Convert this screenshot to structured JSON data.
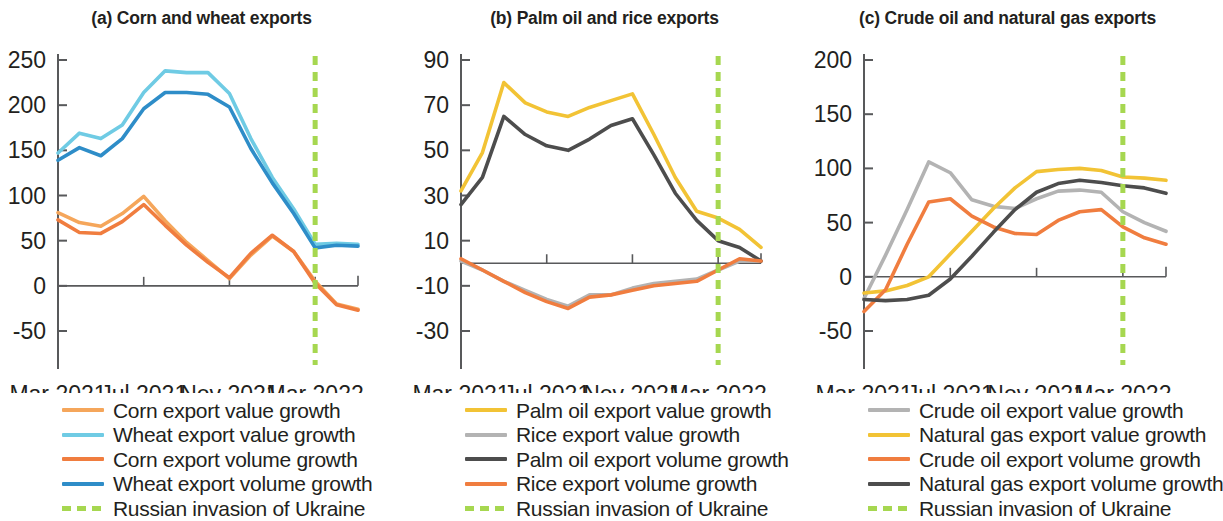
{
  "figure": {
    "panels": [
      {
        "id": "panel-a",
        "title": "(a) Corn and wheat exports",
        "legend": [
          {
            "label": "Corn export value growth",
            "color": "#f5a65b",
            "style": "solid"
          },
          {
            "label": "Wheat export value growth",
            "color": "#6fcbe4",
            "style": "solid"
          },
          {
            "label": "Corn export volume growth",
            "color": "#f07d3f",
            "style": "solid"
          },
          {
            "label": "Wheat export volume growth",
            "color": "#2e8dc8",
            "style": "solid"
          },
          {
            "label": "Russian invasion of Ukraine",
            "color": "#a6d750",
            "style": "dashed"
          }
        ]
      },
      {
        "id": "panel-b",
        "title": "(b) Palm oil and rice exports",
        "legend": [
          {
            "label": "Palm oil export value growth",
            "color": "#f2c335",
            "style": "solid"
          },
          {
            "label": "Rice export value growth",
            "color": "#b3b3b3",
            "style": "solid"
          },
          {
            "label": "Palm oil export volume growth",
            "color": "#4d4d4d",
            "style": "solid"
          },
          {
            "label": "Rice export volume growth",
            "color": "#f07d3f",
            "style": "solid"
          },
          {
            "label": "Russian invasion of Ukraine",
            "color": "#a6d750",
            "style": "dashed"
          }
        ]
      },
      {
        "id": "panel-c",
        "title": "(c) Crude oil and natural gas exports",
        "legend": [
          {
            "label": "Crude oil export value growth",
            "color": "#b3b3b3",
            "style": "solid"
          },
          {
            "label": "Natural gas export value growth",
            "color": "#f2c335",
            "style": "solid"
          },
          {
            "label": "Crude oil export volume growth",
            "color": "#f07d3f",
            "style": "solid"
          },
          {
            "label": "Natural gas export volume growth",
            "color": "#4d4d4d",
            "style": "solid"
          },
          {
            "label": "Russian invasion of Ukraine",
            "color": "#a6d750",
            "style": "dashed"
          }
        ]
      }
    ]
  },
  "chart_data": [
    {
      "type": "line",
      "title": "(a) Corn and wheat exports",
      "xlabel": "",
      "ylabel": "",
      "x": [
        "Mar 2021",
        "Apr 2021",
        "May 2021",
        "Jun 2021",
        "Jul 2021",
        "Aug 2021",
        "Sep 2021",
        "Oct 2021",
        "Nov 2021",
        "Dec 2021",
        "Jan 2022",
        "Feb 2022",
        "Mar 2022",
        "Apr 2022",
        "May 2022"
      ],
      "xticklabels": [
        "Mar 2021",
        "Jul 2021",
        "Nov 2021",
        "Mar 2022"
      ],
      "xtickindex": [
        0,
        4,
        8,
        12
      ],
      "ylim": [
        -50,
        250
      ],
      "yticks": [
        -50,
        0,
        50,
        100,
        150,
        200,
        250
      ],
      "grid": false,
      "legend_position": "below",
      "annotations": [
        {
          "type": "vline",
          "label": "Russian invasion of Ukraine",
          "x": "Mar 2022",
          "color": "#a6d750",
          "style": "dashed"
        }
      ],
      "series": [
        {
          "name": "Corn export value growth",
          "color": "#f5a65b",
          "values": [
            81,
            70,
            66,
            80,
            99,
            72,
            48,
            28,
            8,
            34,
            55,
            38,
            5,
            -20,
            -26
          ]
        },
        {
          "name": "Wheat export value growth",
          "color": "#6fcbe4",
          "values": [
            147,
            169,
            163,
            178,
            214,
            238,
            236,
            236,
            213,
            163,
            120,
            85,
            46,
            47,
            46
          ]
        },
        {
          "name": "Corn export volume growth",
          "color": "#f07d3f",
          "values": [
            73,
            59,
            58,
            71,
            90,
            67,
            45,
            26,
            9,
            36,
            56,
            38,
            3,
            -21,
            -27
          ]
        },
        {
          "name": "Wheat export volume growth",
          "color": "#2e8dc8",
          "values": [
            139,
            153,
            144,
            163,
            196,
            214,
            214,
            212,
            198,
            152,
            114,
            80,
            42,
            45,
            44
          ]
        }
      ]
    },
    {
      "type": "line",
      "title": "(b) Palm oil and rice exports",
      "xlabel": "",
      "ylabel": "",
      "x": [
        "Mar 2021",
        "Apr 2021",
        "May 2021",
        "Jun 2021",
        "Jul 2021",
        "Aug 2021",
        "Sep 2021",
        "Oct 2021",
        "Nov 2021",
        "Dec 2021",
        "Jan 2022",
        "Feb 2022",
        "Mar 2022",
        "Apr 2022",
        "May 2022"
      ],
      "xticklabels": [
        "Mar 2021",
        "Jul 2021",
        "Nov 2021",
        "Mar 2022"
      ],
      "xtickindex": [
        0,
        4,
        8,
        12
      ],
      "ylim": [
        -30,
        90
      ],
      "yticks": [
        -30,
        -10,
        10,
        30,
        50,
        70,
        90
      ],
      "grid": false,
      "legend_position": "below",
      "annotations": [
        {
          "type": "vline",
          "label": "Russian invasion of Ukraine",
          "x": "Mar 2022",
          "color": "#a6d750",
          "style": "dashed"
        }
      ],
      "series": [
        {
          "name": "Palm oil export value growth",
          "color": "#f2c335",
          "values": [
            32,
            49,
            80,
            71,
            67,
            65,
            69,
            72,
            75,
            57,
            38,
            23,
            20,
            15,
            7
          ]
        },
        {
          "name": "Rice export value growth",
          "color": "#b3b3b3",
          "values": [
            1,
            -3,
            -8,
            -12,
            -16,
            -19,
            -14,
            -14,
            -11,
            -9,
            -8,
            -7,
            -3,
            1,
            1
          ]
        },
        {
          "name": "Palm oil export volume growth",
          "color": "#4d4d4d",
          "values": [
            26,
            38,
            65,
            57,
            52,
            50,
            55,
            61,
            64,
            48,
            31,
            19,
            10,
            7,
            1
          ]
        },
        {
          "name": "Rice export volume growth",
          "color": "#f07d3f",
          "values": [
            2,
            -3,
            -8,
            -13,
            -17,
            -20,
            -15,
            -14,
            -12,
            -10,
            -9,
            -8,
            -3,
            2,
            1
          ]
        }
      ]
    },
    {
      "type": "line",
      "title": "(c) Crude oil and natural gas exports",
      "xlabel": "",
      "ylabel": "",
      "x": [
        "Mar 2021",
        "Apr 2021",
        "May 2021",
        "Jun 2021",
        "Jul 2021",
        "Aug 2021",
        "Sep 2021",
        "Oct 2021",
        "Nov 2021",
        "Dec 2021",
        "Jan 2022",
        "Feb 2022",
        "Mar 2022",
        "Apr 2022",
        "May 2022"
      ],
      "xticklabels": [
        "Mar 2021",
        "Jul 2021",
        "Nov 2021",
        "Mar 2022"
      ],
      "xtickindex": [
        0,
        4,
        8,
        12
      ],
      "ylim": [
        -50,
        200
      ],
      "yticks": [
        -50,
        0,
        50,
        100,
        150,
        200
      ],
      "grid": false,
      "legend_position": "below",
      "annotations": [
        {
          "type": "vline",
          "label": "Russian invasion of Ukraine",
          "x": "Mar 2022",
          "color": "#a6d750",
          "style": "dashed"
        }
      ],
      "series": [
        {
          "name": "Crude oil export value growth",
          "color": "#b3b3b3",
          "values": [
            -20,
            20,
            62,
            106,
            96,
            71,
            65,
            63,
            72,
            79,
            80,
            78,
            60,
            50,
            42
          ]
        },
        {
          "name": "Natural gas export value growth",
          "color": "#f2c335",
          "values": [
            -15,
            -13,
            -8,
            0,
            21,
            42,
            63,
            82,
            97,
            99,
            100,
            98,
            92,
            91,
            89
          ]
        },
        {
          "name": "Crude oil export volume growth",
          "color": "#f07d3f",
          "values": [
            -32,
            -12,
            30,
            69,
            72,
            56,
            46,
            40,
            39,
            52,
            60,
            62,
            46,
            36,
            30
          ]
        },
        {
          "name": "Natural gas export volume growth",
          "color": "#4d4d4d",
          "values": [
            -21,
            -22,
            -21,
            -17,
            -2,
            19,
            41,
            62,
            78,
            86,
            89,
            87,
            84,
            82,
            77
          ]
        }
      ]
    }
  ]
}
